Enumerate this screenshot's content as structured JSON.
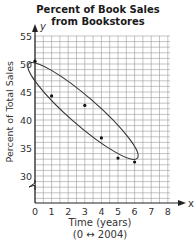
{
  "chart_data": {
    "type": "scatter",
    "title": "Percent of Book Sales from Bookstores",
    "title_lines": [
      "Percent of Book Sales",
      "from Bookstores"
    ],
    "xlabel": "Time (years)",
    "xlabel_note": "(0 ↔ 2004)",
    "ylabel": "Percent of Total Sales",
    "x_axis_letter": "x",
    "y_axis_letter": "y",
    "xlim": [
      0,
      8
    ],
    "ylim": [
      30,
      55
    ],
    "y_axis_break": true,
    "grid": true,
    "x_ticks": [
      0,
      1,
      2,
      3,
      4,
      5,
      6,
      7,
      8
    ],
    "y_ticks": [
      30,
      35,
      40,
      45,
      50,
      55
    ],
    "points": [
      {
        "x": 0,
        "y": 50.5
      },
      {
        "x": 1,
        "y": 44.3
      },
      {
        "x": 3,
        "y": 42.6
      },
      {
        "x": 4,
        "y": 36.8
      },
      {
        "x": 5,
        "y": 33.2
      },
      {
        "x": 6,
        "y": 32.5
      }
    ],
    "annotations": [
      {
        "type": "ellipse",
        "description": "Ellipse enclosing all data points, showing a negative linear trend"
      }
    ]
  }
}
